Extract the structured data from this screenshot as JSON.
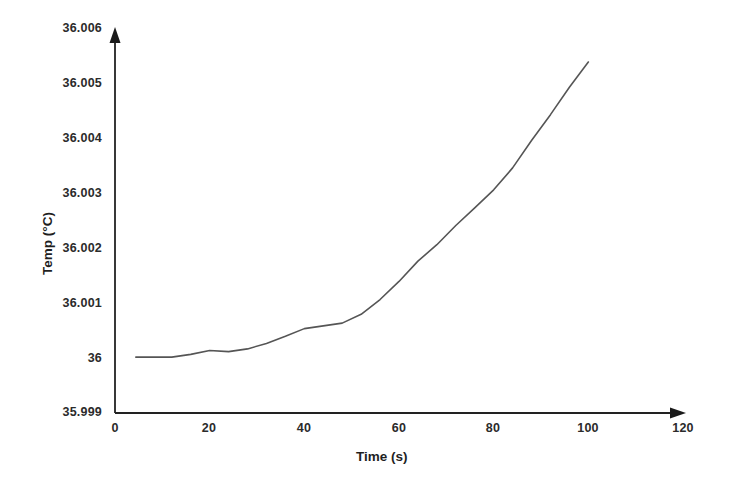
{
  "chart_data": {
    "type": "line",
    "title": "",
    "subtitle": "",
    "xlabel": "Time (s)",
    "ylabel": "Temp (°C)",
    "xlim": [
      0,
      120
    ],
    "ylim": [
      35.999,
      36.006
    ],
    "xticks": [
      "0",
      "20",
      "40",
      "60",
      "80",
      "100",
      "120"
    ],
    "xtick_values": [
      0,
      20,
      40,
      60,
      80,
      100,
      120
    ],
    "yticks": [
      "35.999",
      "36",
      "36.001",
      "36.002",
      "36.003",
      "36.004",
      "36.005",
      "36.006"
    ],
    "ytick_values": [
      35.999,
      36.0,
      36.001,
      36.002,
      36.003,
      36.004,
      36.005,
      36.006
    ],
    "grid": false,
    "legend": false,
    "legend_position": "none",
    "line_color": "#555555",
    "line_width": 1.6,
    "axis_color": "#222222",
    "background_color": "#ffffff",
    "annotations": [],
    "series": [
      {
        "name": "Temp",
        "x": [
          4.4,
          8,
          12,
          16,
          20,
          24,
          28,
          32,
          36,
          40,
          44,
          48,
          52,
          56,
          60,
          64,
          68,
          72,
          76,
          80,
          84,
          88,
          92,
          96,
          100
        ],
        "values": [
          36.0,
          36.0,
          36.0,
          36.00005,
          36.00012,
          36.0001,
          36.00015,
          36.00025,
          36.00038,
          36.00052,
          36.00057,
          36.00062,
          36.00078,
          36.00105,
          36.00138,
          36.00175,
          36.00205,
          36.0024,
          36.00272,
          36.00305,
          36.00345,
          36.00395,
          36.00442,
          36.00492,
          36.00538
        ]
      }
    ]
  },
  "axes_geometry": {
    "plot_left_px": 115,
    "plot_right_px": 683,
    "plot_top_px": 28,
    "plot_bottom_px": 412
  }
}
